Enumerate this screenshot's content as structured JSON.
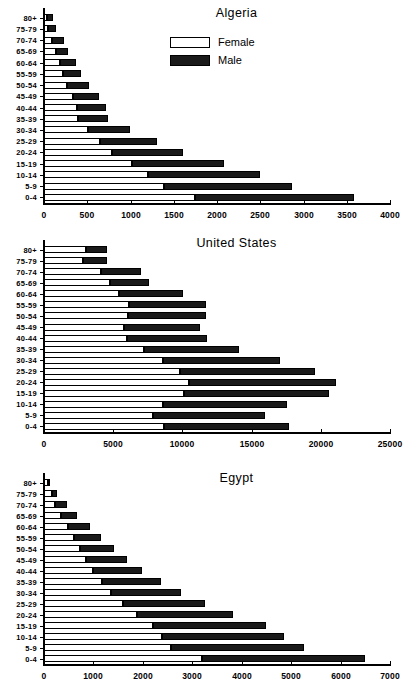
{
  "legend": {
    "female_label": "Female",
    "male_label": "Male",
    "female_color": "#ffffff",
    "male_color": "#1a1a1a"
  },
  "panels": [
    {
      "id": "algeria",
      "title": "Algeria"
    },
    {
      "id": "united-states",
      "title": "United States"
    },
    {
      "id": "egypt",
      "title": "Egypt"
    }
  ],
  "chart_data": [
    {
      "type": "bar",
      "title": "Algeria",
      "subtype": "population-pyramid-stacked",
      "orientation": "horizontal",
      "xlabel": "",
      "ylabel": "",
      "xlim": [
        0,
        4000
      ],
      "xticks": [
        0,
        500,
        1000,
        1500,
        2000,
        2500,
        3000,
        3500,
        4000
      ],
      "xtick_labels": [
        "0",
        "500",
        "1000",
        "1500",
        "2000",
        "2500",
        "3000",
        "3500",
        "4000"
      ],
      "grid": false,
      "legend_position": "top-center",
      "categories": [
        "80+",
        "75-79",
        "70-74",
        "65-69",
        "60-64",
        "55-59",
        "50-54",
        "45-49",
        "40-44",
        "35-39",
        "30-34",
        "25-29",
        "20-24",
        "15-19",
        "10-14",
        "5-9",
        "0-4"
      ],
      "series": [
        {
          "name": "Female",
          "values": [
            40,
            50,
            90,
            140,
            185,
            215,
            265,
            340,
            385,
            390,
            510,
            650,
            790,
            1015,
            1200,
            1390,
            1750
          ]
        },
        {
          "name": "Male",
          "values": [
            65,
            95,
            135,
            140,
            180,
            205,
            255,
            300,
            335,
            350,
            490,
            660,
            825,
            1060,
            1290,
            1480,
            1840
          ]
        }
      ],
      "totals": [
        105,
        145,
        225,
        280,
        365,
        420,
        520,
        640,
        720,
        740,
        1000,
        1310,
        1615,
        2075,
        2490,
        2870,
        3590
      ]
    },
    {
      "type": "bar",
      "title": "United States",
      "subtype": "population-pyramid-stacked",
      "orientation": "horizontal",
      "xlabel": "",
      "ylabel": "",
      "xlim": [
        0,
        25000
      ],
      "xticks": [
        0,
        5000,
        10000,
        15000,
        20000,
        25000
      ],
      "xtick_labels": [
        "0",
        "5000",
        "10000",
        "15000",
        "20000",
        "25000"
      ],
      "grid": false,
      "legend_position": "none",
      "categories": [
        "80+",
        "75-79",
        "70-74",
        "65-69",
        "60-64",
        "55-59",
        "50-54",
        "45-49",
        "40-44",
        "35-39",
        "30-34",
        "25-29",
        "20-24",
        "15-19",
        "10-14",
        "5-9",
        "0-4"
      ],
      "series": [
        {
          "name": "Female",
          "values": [
            3000,
            2850,
            4100,
            4750,
            5400,
            6150,
            6100,
            5750,
            6000,
            7200,
            8600,
            9800,
            10500,
            10150,
            8600,
            7850,
            8700
          ]
        },
        {
          "name": "Male",
          "values": [
            1550,
            1750,
            2900,
            2800,
            4600,
            5550,
            5600,
            5500,
            5750,
            6850,
            8450,
            9750,
            10650,
            10500,
            8950,
            8100,
            9050
          ]
        }
      ],
      "totals": [
        4550,
        4600,
        7000,
        7550,
        10000,
        11700,
        11700,
        11250,
        11750,
        14050,
        17050,
        19550,
        21150,
        20650,
        17550,
        15950,
        17750
      ]
    },
    {
      "type": "bar",
      "title": "Egypt",
      "subtype": "population-pyramid-stacked",
      "orientation": "horizontal",
      "xlabel": "",
      "ylabel": "",
      "xlim": [
        0,
        7000
      ],
      "xticks": [
        0,
        1000,
        2000,
        3000,
        4000,
        5000,
        6000,
        7000
      ],
      "xtick_labels": [
        "0",
        "1000",
        "2000",
        "3000",
        "4000",
        "5000",
        "6000",
        "7000"
      ],
      "grid": false,
      "legend_position": "none",
      "categories": [
        "80+",
        "75-79",
        "70-74",
        "65-69",
        "60-64",
        "55-59",
        "50-54",
        "45-49",
        "40-44",
        "35-39",
        "30-34",
        "25-29",
        "20-24",
        "15-19",
        "10-14",
        "5-9",
        "0-4"
      ],
      "series": [
        {
          "name": "Female",
          "values": [
            75,
            160,
            215,
            350,
            480,
            600,
            720,
            850,
            1000,
            1170,
            1360,
            1600,
            1880,
            2200,
            2380,
            2560,
            3200
          ]
        },
        {
          "name": "Male",
          "values": [
            45,
            110,
            250,
            330,
            440,
            540,
            680,
            830,
            1000,
            1200,
            1420,
            1650,
            1940,
            2280,
            2470,
            2690,
            3300
          ]
        }
      ],
      "totals": [
        120,
        270,
        465,
        680,
        920,
        1140,
        1400,
        1680,
        2000,
        2370,
        2780,
        3250,
        3820,
        4480,
        4850,
        5250,
        6500
      ]
    }
  ]
}
